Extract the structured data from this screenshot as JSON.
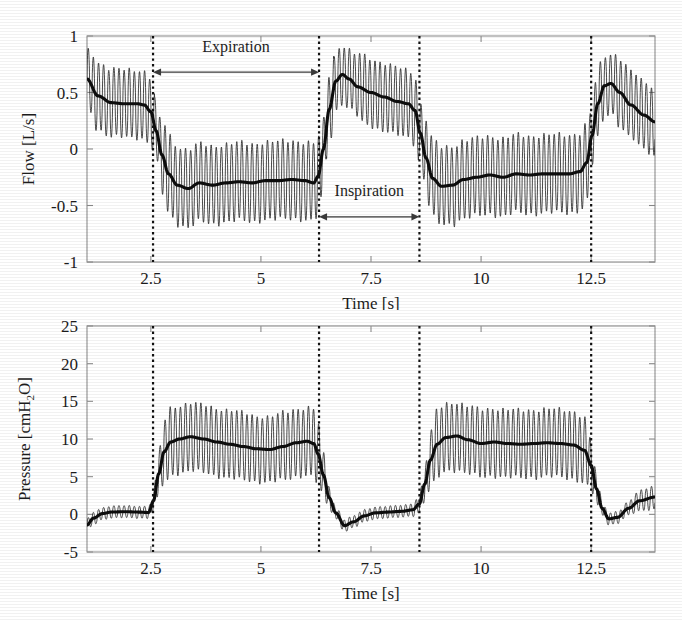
{
  "figure": {
    "background": "#ffffff",
    "ink_color": "#1a1a1a",
    "axis_color": "#8e8e8e"
  },
  "chart_data": [
    {
      "id": "flow-panel",
      "type": "line",
      "title": "",
      "xlabel": "Time [s]",
      "ylabel": "Flow [L/s]",
      "ylabel_parts": {
        "name": "Flow",
        "unit": "[L/s]"
      },
      "xlim": [
        1.05,
        13.95
      ],
      "ylim": [
        -1,
        1
      ],
      "xticks": [
        2.5,
        5,
        7.5,
        10,
        12.5
      ],
      "xticklabels": [
        "2.5",
        "5",
        "7.5",
        "10",
        "12.5"
      ],
      "yticks": [
        -1,
        -0.5,
        0,
        0.5,
        1
      ],
      "yticklabels": [
        "-1",
        "-0.5",
        "0",
        "0.5",
        "1"
      ],
      "grid": false,
      "legend": "none",
      "series": [
        {
          "name": "Oscillatory flow",
          "role": "fast",
          "description": "High-frequency oscillation superimposed on mean flow",
          "oscillation_hz": 8.6,
          "amplitude_inspiration": 0.42,
          "amplitude_expiration": 0.3
        },
        {
          "name": "Mean flow",
          "role": "slow",
          "description": "Breath-cycle mean flow, thick trace",
          "x": [
            1.05,
            1.3,
            1.6,
            1.9,
            2.2,
            2.35,
            2.5,
            2.62,
            2.75,
            2.9,
            3.1,
            3.35,
            3.6,
            3.9,
            4.2,
            4.5,
            4.8,
            5.1,
            5.4,
            5.7,
            6.0,
            6.2,
            6.3,
            6.42,
            6.55,
            6.7,
            6.85,
            7.0,
            7.2,
            7.5,
            7.8,
            8.1,
            8.35,
            8.5,
            8.62,
            8.75,
            8.9,
            9.1,
            9.35,
            9.6,
            9.9,
            10.2,
            10.5,
            10.8,
            11.1,
            11.4,
            11.7,
            12.0,
            12.25,
            12.4,
            12.52,
            12.65,
            12.8,
            12.95,
            13.15,
            13.4,
            13.7,
            13.95
          ],
          "y": [
            0.62,
            0.47,
            0.41,
            0.4,
            0.4,
            0.39,
            0.33,
            0.16,
            -0.05,
            -0.22,
            -0.32,
            -0.35,
            -0.3,
            -0.32,
            -0.3,
            -0.29,
            -0.3,
            -0.28,
            -0.28,
            -0.27,
            -0.28,
            -0.3,
            -0.24,
            0.0,
            0.35,
            0.6,
            0.66,
            0.62,
            0.55,
            0.5,
            0.46,
            0.42,
            0.4,
            0.34,
            0.14,
            -0.08,
            -0.26,
            -0.33,
            -0.32,
            -0.27,
            -0.25,
            -0.23,
            -0.25,
            -0.22,
            -0.23,
            -0.22,
            -0.22,
            -0.22,
            -0.2,
            -0.12,
            0.12,
            0.4,
            0.56,
            0.58,
            0.5,
            0.39,
            0.3,
            0.24
          ]
        }
      ],
      "dividers": [
        {
          "x": 2.55,
          "label": ""
        },
        {
          "x": 6.32,
          "label": ""
        },
        {
          "x": 8.6,
          "label": ""
        },
        {
          "x": 12.5,
          "label": ""
        }
      ],
      "annotations": [
        {
          "text": "Expiration",
          "x_start": 2.55,
          "x_end": 6.32,
          "y": 0.68,
          "label_y": 0.86,
          "style": "double-arrow"
        },
        {
          "text": "Inspiration",
          "x_start": 6.32,
          "x_end": 8.6,
          "y": -0.6,
          "label_y": -0.42,
          "style": "double-arrow"
        }
      ]
    },
    {
      "id": "pressure-panel",
      "type": "line",
      "title": "",
      "xlabel": "Time [s]",
      "ylabel": "Pressure [cmH2O]",
      "ylabel_parts": {
        "name": "Pressure",
        "unit_pre": "[cmH",
        "unit_sub": "2",
        "unit_post": "O]"
      },
      "xlim": [
        1.05,
        13.95
      ],
      "ylim": [
        -5,
        25
      ],
      "xticks": [
        2.5,
        5,
        7.5,
        10,
        12.5
      ],
      "xticklabels": [
        "2.5",
        "5",
        "7.5",
        "10",
        "12.5"
      ],
      "yticks": [
        -5,
        0,
        5,
        10,
        15,
        20,
        25
      ],
      "yticklabels": [
        "-5",
        "0",
        "5",
        "10",
        "15",
        "20",
        "25"
      ],
      "grid": false,
      "legend": "none",
      "series": [
        {
          "name": "Oscillatory pressure",
          "role": "fast",
          "description": "High-frequency pressure oscillation about the mean airway pressure",
          "oscillation_hz": 8.6,
          "amplitude_plateau": 9.0,
          "amplitude_baseline": 1.6
        },
        {
          "name": "Mean airway pressure",
          "role": "slow",
          "description": "Breath-cycle mean pressure, thick trace",
          "x": [
            1.05,
            1.2,
            1.4,
            1.6,
            1.9,
            2.2,
            2.45,
            2.56,
            2.68,
            2.8,
            2.95,
            3.15,
            3.4,
            3.7,
            4.0,
            4.3,
            4.6,
            4.9,
            5.2,
            5.5,
            5.8,
            6.05,
            6.2,
            6.3,
            6.42,
            6.55,
            6.7,
            6.9,
            7.1,
            7.35,
            7.6,
            7.9,
            8.2,
            8.45,
            8.6,
            8.72,
            8.85,
            9.0,
            9.2,
            9.45,
            9.7,
            10.0,
            10.3,
            10.6,
            10.9,
            11.2,
            11.5,
            11.8,
            12.1,
            12.35,
            12.5,
            12.62,
            12.75,
            12.9,
            13.1,
            13.35,
            13.6,
            13.95
          ],
          "y": [
            -1.4,
            -0.5,
            0.1,
            0.3,
            0.35,
            0.3,
            0.25,
            1.8,
            5.4,
            8.3,
            9.6,
            10.0,
            10.3,
            10.0,
            9.6,
            9.3,
            9.0,
            8.7,
            8.6,
            9.0,
            9.5,
            9.7,
            9.4,
            8.0,
            5.2,
            2.2,
            0.2,
            -1.5,
            -1.0,
            -0.2,
            0.2,
            0.3,
            0.4,
            0.6,
            1.4,
            4.0,
            7.2,
            9.3,
            10.2,
            10.4,
            9.9,
            9.4,
            9.6,
            9.4,
            9.3,
            9.4,
            9.5,
            9.4,
            9.2,
            8.5,
            6.5,
            3.4,
            0.8,
            -0.6,
            -0.4,
            0.8,
            1.8,
            2.3
          ]
        }
      ],
      "dividers": [
        {
          "x": 2.55,
          "label": ""
        },
        {
          "x": 6.32,
          "label": ""
        },
        {
          "x": 8.6,
          "label": ""
        },
        {
          "x": 12.5,
          "label": ""
        }
      ],
      "annotations": []
    }
  ]
}
